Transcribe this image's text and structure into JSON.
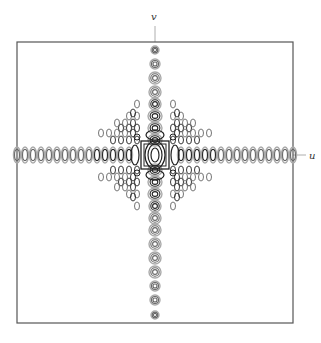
{
  "figure": {
    "type": "contour-plot",
    "axes": {
      "horizontal_label": "u",
      "vertical_label": "v"
    },
    "frame": {
      "x": 17,
      "y": 42,
      "width": 276,
      "height": 281,
      "stroke": "#555555"
    },
    "center": {
      "x": 155,
      "y": 155
    },
    "colors": {
      "contour_dark": "#222222",
      "contour_mid": "#666666",
      "contour_light": "#aaaaaa",
      "frame": "#555555",
      "axis_tick": "#999999"
    },
    "vertical_column": {
      "cx": 155,
      "spots_y": [
        50,
        64,
        78,
        92,
        104,
        116,
        128,
        140,
        170,
        182,
        194,
        206,
        218,
        230,
        244,
        258,
        272,
        286,
        300,
        315
      ],
      "spot_rx": [
        4,
        5,
        6,
        6,
        6,
        7,
        7,
        7,
        7,
        7,
        7,
        6,
        6,
        6,
        6,
        6,
        6,
        5,
        5,
        4
      ],
      "spot_ry": [
        4,
        5,
        6,
        6,
        6,
        6,
        6,
        6,
        6,
        6,
        6,
        6,
        6,
        6,
        6,
        6,
        6,
        5,
        5,
        4
      ]
    },
    "horizontal_row": {
      "cy": 155,
      "spots_x": [
        17,
        25,
        33,
        41,
        49,
        57,
        65,
        73,
        81,
        89,
        97,
        105,
        113,
        121,
        129,
        181,
        189,
        197,
        205,
        213,
        221,
        229,
        237,
        245,
        253,
        261,
        269,
        277,
        285,
        293
      ],
      "spot_rx": 3.5,
      "spot_ry": 8
    }
  }
}
